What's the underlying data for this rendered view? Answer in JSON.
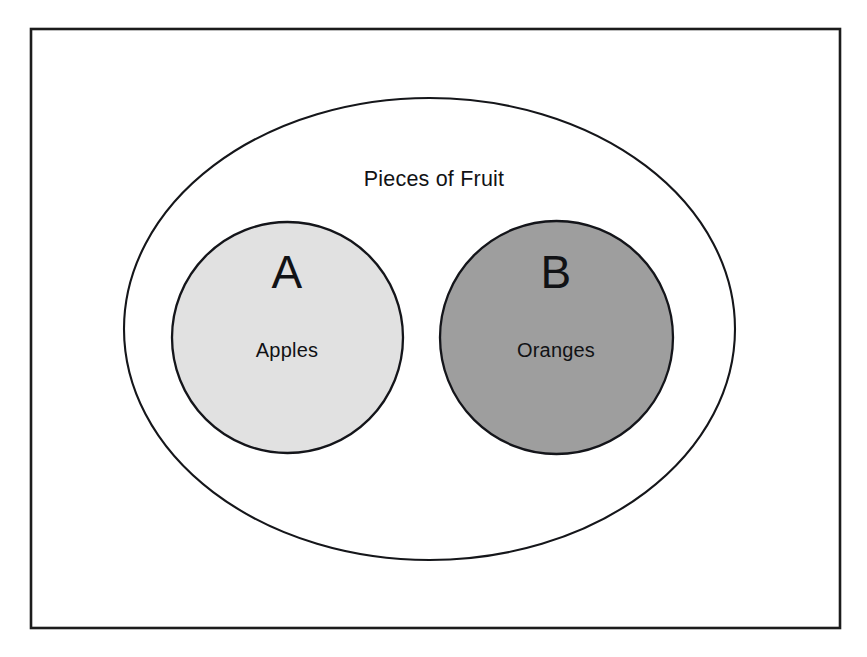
{
  "figure": {
    "type": "venn-diagram",
    "background_color": "#ffffff",
    "frame": {
      "name": "outer-border",
      "x": 31,
      "y": 29,
      "width": 809,
      "height": 599,
      "stroke_color": "#1c1c1c",
      "fill_color": "#ffffff"
    },
    "universe": {
      "label": "Pieces of Fruit",
      "label_x": 434,
      "label_y": 186,
      "cx": 429.5,
      "cy": 329,
      "rx": 305.5,
      "ry": 231,
      "fill_color": "#ffffff",
      "stroke_color": "#15161a"
    },
    "sets": [
      {
        "key": "A",
        "letter": "A",
        "name": "Apples",
        "cx": 287.5,
        "cy": 337.5,
        "r": 115.5,
        "fill_color": "#e1e1e1",
        "stroke_color": "#14151a",
        "letter_x": 287,
        "letter_y": 288,
        "name_x": 287,
        "name_y": 357
      },
      {
        "key": "B",
        "letter": "B",
        "name": "Oranges",
        "cx": 556.5,
        "cy": 337.5,
        "r": 116.5,
        "fill_color": "#9e9e9e",
        "stroke_color": "#14151a",
        "letter_x": 556,
        "letter_y": 288,
        "name_x": 556,
        "name_y": 357
      }
    ]
  },
  "chart_data": {
    "type": "diagram",
    "diagram_kind": "venn-euler",
    "title": "Pieces of Fruit",
    "universal_set": "Pieces of Fruit",
    "relationship": "disjoint",
    "sets": [
      {
        "label": "A",
        "description": "Apples",
        "shade": "light-gray"
      },
      {
        "label": "B",
        "description": "Oranges",
        "shade": "medium-gray"
      }
    ],
    "intersection": "empty",
    "annotations": [
      "A and B are disjoint subsets of the universal set Pieces of Fruit"
    ]
  }
}
